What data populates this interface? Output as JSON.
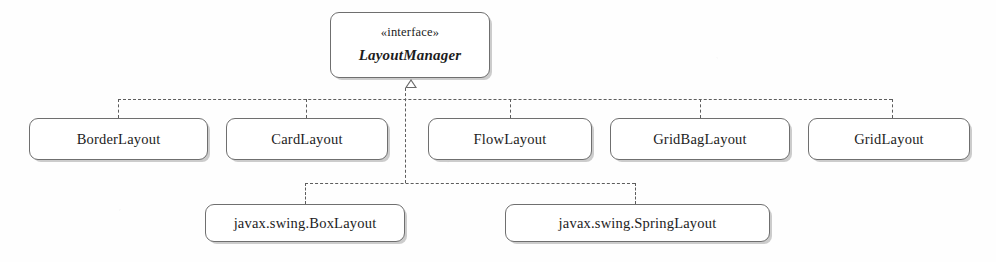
{
  "diagram": {
    "type": "uml-class-diagram",
    "relationship": "realization",
    "line_color": "#5d5d5d",
    "node_border_color": "#6f6f6f",
    "node_fill_color": "#ffffff",
    "background_color": "#fefefe"
  },
  "interface_node": {
    "stereotype": "«interface»",
    "name": "LayoutManager"
  },
  "implementors": [
    {
      "name": "BorderLayout"
    },
    {
      "name": "CardLayout"
    },
    {
      "name": "FlowLayout"
    },
    {
      "name": "GridBagLayout"
    },
    {
      "name": "GridLayout"
    },
    {
      "name": "javax.swing.BoxLayout"
    },
    {
      "name": "javax.swing.SpringLayout"
    }
  ]
}
